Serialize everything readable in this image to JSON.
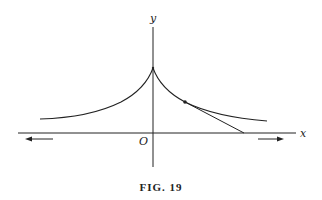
{
  "figure": {
    "caption": "FIG. 19"
  },
  "axes": {
    "x_label": "x",
    "y_label": "y",
    "origin_label": "O"
  },
  "elements": {
    "curve": "tractrix",
    "cusp_point": "on y-axis",
    "marked_point": "point on right branch",
    "tangent_line": "from marked point to x-axis",
    "arrows": [
      "left arrow below x-axis",
      "right arrow below x-axis"
    ]
  },
  "colors": {
    "stroke": "#222222",
    "background": "#ffffff"
  }
}
